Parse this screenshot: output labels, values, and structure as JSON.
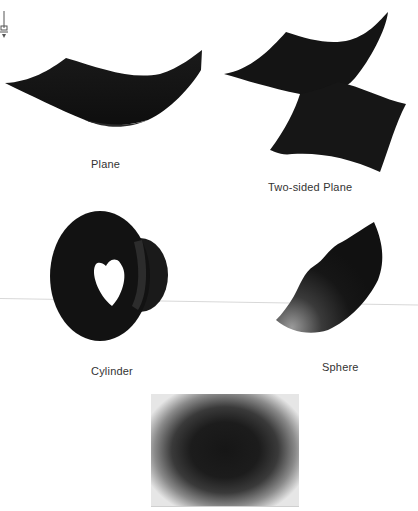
{
  "figure": {
    "icon": "pin-icon",
    "items": [
      {
        "id": "plane",
        "label": "Plane"
      },
      {
        "id": "two-sided-plane",
        "label": "Two-sided Plane"
      },
      {
        "id": "cylinder",
        "label": "Cylinder"
      },
      {
        "id": "sphere",
        "label": "Sphere"
      },
      {
        "id": "gradient-rectangle",
        "label": ""
      }
    ],
    "colors": {
      "shape_fill": "#151515",
      "highlight": "#8a8a8a",
      "caption": "#333333",
      "background": "#ffffff"
    }
  }
}
